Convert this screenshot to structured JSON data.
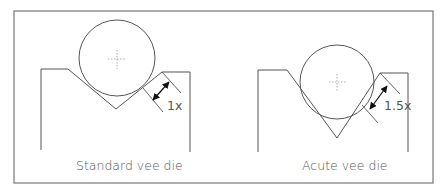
{
  "figure": {
    "panels": [
      {
        "id": "standard",
        "caption": "Standard vee die",
        "dimension_label": "1x"
      },
      {
        "id": "acute",
        "caption": "Acute vee die",
        "dimension_label": "1.5x"
      }
    ],
    "colors": {
      "line": "#555555",
      "frame": "#777777",
      "text": "#555555",
      "crosshair": "#999999"
    }
  }
}
